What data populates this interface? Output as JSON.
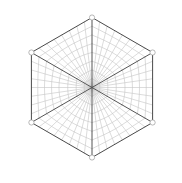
{
  "figure": {
    "kind": "mesh-diagram",
    "background_color": "#ffffff",
    "width": 182,
    "height": 183
  },
  "chart_data": {
    "type": "diagram",
    "subtitle": "",
    "xlabel": "",
    "ylabel": "",
    "grid": true,
    "legend": null,
    "annotations": [],
    "geometry": {
      "shape": "hexagon",
      "orientation": "pointy-top",
      "center": [
        92,
        87.5
      ],
      "circumradius": 70,
      "vertex_count": 6,
      "sector_count": 6,
      "radial_divisions": 8,
      "angular_divisions": 8,
      "vertices": [
        {
          "label": "v1",
          "x": 92,
          "y": 17.5,
          "angle_deg": 90
        },
        {
          "label": "v2",
          "x": 152.6,
          "y": 52.5,
          "angle_deg": 30
        },
        {
          "label": "v3",
          "x": 152.6,
          "y": 122.5,
          "angle_deg": -30
        },
        {
          "label": "v4",
          "x": 92,
          "y": 157.5,
          "angle_deg": -90
        },
        {
          "label": "v5",
          "x": 31.4,
          "y": 122.5,
          "angle_deg": -150
        },
        {
          "label": "v6",
          "x": 31.4,
          "y": 52.5,
          "angle_deg": 150
        }
      ],
      "edge_midpoints": [
        {
          "x": 122.3,
          "y": 35.0
        },
        {
          "x": 152.6,
          "y": 87.5
        },
        {
          "x": 122.3,
          "y": 140.0
        },
        {
          "x": 61.7,
          "y": 140.0
        },
        {
          "x": 31.4,
          "y": 87.5
        },
        {
          "x": 61.7,
          "y": 35.0
        }
      ]
    },
    "styles": {
      "boundary_color": "#4a4a4a",
      "boundary_width": 1.0,
      "spoke_color": "#555555",
      "spoke_width": 1.0,
      "grid_color": "#b9b9b9",
      "grid_width": 0.5,
      "vertex_marker_color": "#9a9a9a",
      "vertex_marker_fill": "#ffffff",
      "vertex_marker_radius": 2.6
    }
  }
}
